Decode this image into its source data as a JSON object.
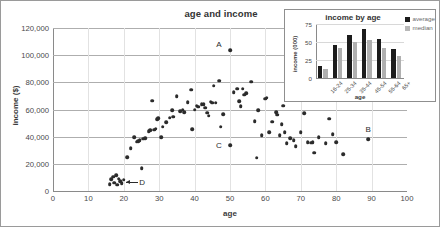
{
  "chart_data": [
    {
      "type": "scatter",
      "title": "age and income",
      "xlabel": "age",
      "ylabel": "income ($)",
      "xlim": [
        0,
        100
      ],
      "ylim": [
        0,
        120000
      ],
      "xticks": [
        "0",
        "10",
        "20",
        "30",
        "40",
        "50",
        "60",
        "70",
        "80",
        "90",
        "100"
      ],
      "yticks": [
        "0",
        "20,000",
        "40,000",
        "60,000",
        "80,000",
        "100,000",
        "120,000"
      ],
      "grid": "horizontal-major-vertical-minor",
      "legend": "none",
      "marker_color": "#2b2b2b",
      "annotations": [
        {
          "label": "A",
          "x": 50,
          "y": 103500,
          "note": "high-income outlier"
        },
        {
          "label": "B",
          "x": 89,
          "y": 38000,
          "note": "oldest observation"
        },
        {
          "label": "C",
          "x": 50,
          "y": 33500,
          "note": "low-income mid-age"
        },
        {
          "label": "D",
          "x": 19,
          "y": 7000,
          "note": "young low-income cluster"
        }
      ],
      "points": [
        [
          16,
          5000
        ],
        [
          16.5,
          8500
        ],
        [
          17,
          10500
        ],
        [
          17.3,
          6200
        ],
        [
          17.8,
          11500
        ],
        [
          18.2,
          4700
        ],
        [
          18.6,
          9000
        ],
        [
          19,
          7000
        ],
        [
          19.4,
          5600
        ],
        [
          20,
          8200
        ],
        [
          21,
          24800
        ],
        [
          22,
          31600
        ],
        [
          23,
          39400
        ],
        [
          23.6,
          36300
        ],
        [
          24,
          36800
        ],
        [
          24.5,
          37300
        ],
        [
          25,
          16700
        ],
        [
          25.4,
          38600
        ],
        [
          26,
          38900
        ],
        [
          27,
          44200
        ],
        [
          27.5,
          44900
        ],
        [
          28,
          66400
        ],
        [
          28.6,
          45200
        ],
        [
          29,
          45800
        ],
        [
          29.4,
          52800
        ],
        [
          29.8,
          53600
        ],
        [
          30.6,
          39400
        ],
        [
          31,
          47300
        ],
        [
          32,
          50500
        ],
        [
          33,
          54000
        ],
        [
          33.6,
          59400
        ],
        [
          34,
          54600
        ],
        [
          35,
          69600
        ],
        [
          36,
          58900
        ],
        [
          36.6,
          59800
        ],
        [
          37,
          57900
        ],
        [
          38,
          65200
        ],
        [
          39,
          74700
        ],
        [
          39.4,
          45400
        ],
        [
          40,
          59900
        ],
        [
          40.6,
          62900
        ],
        [
          41,
          62100
        ],
        [
          42,
          63800
        ],
        [
          42.6,
          64100
        ],
        [
          43,
          61400
        ],
        [
          43.6,
          57700
        ],
        [
          44,
          55500
        ],
        [
          44.6,
          65600
        ],
        [
          45,
          65000
        ],
        [
          45.4,
          77600
        ],
        [
          46,
          64900
        ],
        [
          47,
          81300
        ],
        [
          47.4,
          47200
        ],
        [
          48,
          56600
        ],
        [
          50,
          103500
        ],
        [
          50,
          33500
        ],
        [
          51,
          72700
        ],
        [
          52,
          75400
        ],
        [
          52.6,
          66200
        ],
        [
          53,
          62400
        ],
        [
          53.6,
          75200
        ],
        [
          54,
          71000
        ],
        [
          54.6,
          71800
        ],
        [
          56,
          80400
        ],
        [
          57,
          51300
        ],
        [
          57.6,
          24500
        ],
        [
          58,
          59500
        ],
        [
          59,
          41100
        ],
        [
          60,
          67800
        ],
        [
          60.4,
          68800
        ],
        [
          61,
          43300
        ],
        [
          62,
          50900
        ],
        [
          63,
          57900
        ],
        [
          63.4,
          56200
        ],
        [
          64,
          41100
        ],
        [
          64.6,
          49100
        ],
        [
          65,
          62900
        ],
        [
          65.4,
          43400
        ],
        [
          66,
          35000
        ],
        [
          67,
          38800
        ],
        [
          68,
          37500
        ],
        [
          68.6,
          33100
        ],
        [
          70,
          43200
        ],
        [
          71,
          57200
        ],
        [
          72,
          35800
        ],
        [
          73,
          35600
        ],
        [
          73.4,
          35900
        ],
        [
          73.8,
          28300
        ],
        [
          75,
          39600
        ],
        [
          77,
          35200
        ],
        [
          78,
          53200
        ],
        [
          79,
          42000
        ],
        [
          80,
          35900
        ],
        [
          82,
          27000
        ],
        [
          89,
          38000
        ]
      ]
    },
    {
      "type": "bar",
      "title": "income by age",
      "xlabel": "age",
      "ylabel": "income (000)",
      "ylim": [
        0,
        75
      ],
      "yticks": [
        "0",
        "25",
        "50",
        "75"
      ],
      "categories": [
        "16-24",
        "25-34",
        "35-44",
        "45-54",
        "55-64",
        "65+"
      ],
      "legend_position": "top-right",
      "series": [
        {
          "name": "average",
          "color": "#1c1c1c",
          "values": [
            17,
            46,
            60,
            68,
            54,
            40
          ]
        },
        {
          "name": "median",
          "color": "#b0b0b0",
          "values": [
            13,
            42,
            50,
            53,
            42,
            30
          ]
        }
      ]
    }
  ]
}
